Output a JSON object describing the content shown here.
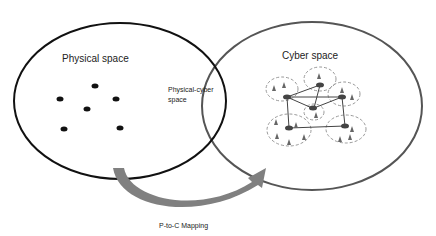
{
  "labels": {
    "physical": "Physical space",
    "cyber": "Cyber space",
    "overlap_line1": "Physical-cyber",
    "overlap_line2": "space",
    "mapping": "P-to-C Mapping"
  },
  "colors": {
    "physical_outline": "#111111",
    "cyber_outline": "#555555",
    "arrow": "#808080",
    "cluster_dash": "#999999",
    "node": "#444444",
    "dot": "#111111"
  },
  "physical_dots_count": 6,
  "cyber_clusters_count": 6
}
